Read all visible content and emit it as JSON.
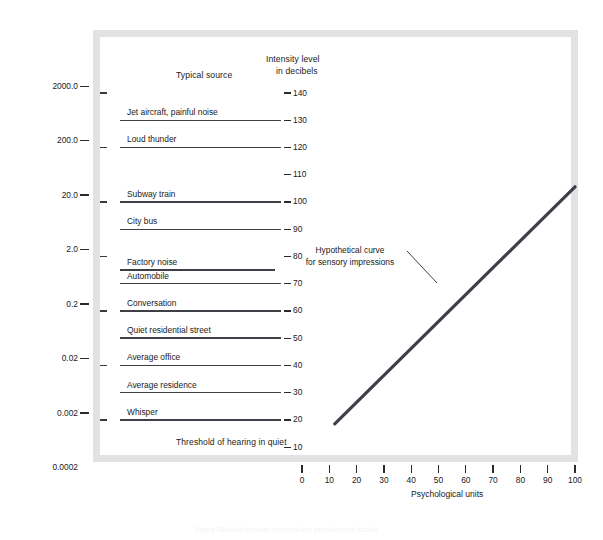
{
  "figure": {
    "y_axis_title": "Physical pressure (dynes/cm",
    "y_axis_title_sup": "2",
    "y_axis_title_tail": ")",
    "x_axis_title": "Psychological units",
    "column_header_source": "Typical source",
    "column_header_intensity_line1": "Intensity level",
    "column_header_intensity_line2": "in decibels",
    "annotation_line1": "Hypothetical curve",
    "annotation_line2": "for sensory impressions",
    "caption_ghost": "Figure  Relation between physical and psychological scales"
  },
  "chart_data": {
    "type": "line",
    "title": "",
    "xlabel": "Psychological units",
    "ylabel": "Physical pressure (dynes/cm2)",
    "xlim": [
      0,
      100
    ],
    "grid": false,
    "legend": "none",
    "x_ticks": [
      0,
      10,
      20,
      30,
      40,
      50,
      60,
      70,
      80,
      90,
      100
    ],
    "x_tick_labels": [
      "0",
      "10",
      "20",
      "30",
      "40",
      "50",
      "60",
      "70",
      "80",
      "90",
      "100"
    ],
    "y_pressure_ticks": [
      "2000.0",
      "200.0",
      "20.0",
      "2.0",
      "0.2",
      "0.02",
      "0.002",
      "0.0002"
    ],
    "y_pressure_values": [
      2000.0,
      200.0,
      20.0,
      2.0,
      0.2,
      0.02,
      0.002,
      0.0002
    ],
    "decibel_ticks": [
      140,
      130,
      120,
      110,
      100,
      90,
      80,
      70,
      60,
      50,
      40,
      30,
      20,
      10
    ],
    "decibel_tick_labels": [
      "140",
      "130",
      "120",
      "110",
      "100",
      "90",
      "80",
      "70",
      "60",
      "50",
      "40",
      "30",
      "20",
      "10"
    ],
    "sources": [
      {
        "label": "Jet aircraft, painful noise",
        "decibels": 130
      },
      {
        "label": "Loud thunder",
        "decibels": 120
      },
      {
        "label": "Subway train",
        "decibels": 100
      },
      {
        "label": "City bus",
        "decibels": 90
      },
      {
        "label": "Factory noise",
        "decibels": 75
      },
      {
        "label": "Automobile",
        "decibels": 70
      },
      {
        "label": "Conversation",
        "decibels": 60
      },
      {
        "label": "Quiet residential street",
        "decibels": 50
      },
      {
        "label": "Average office",
        "decibels": 40
      },
      {
        "label": "Average residence",
        "decibels": 30
      },
      {
        "label": "Whisper",
        "decibels": 20
      }
    ],
    "threshold_note": "Threshold of hearing in quiet",
    "series": [
      {
        "name": "Hypothetical curve for sensory impressions",
        "x": [
          12,
          100
        ],
        "y_decibels": [
          16,
          103
        ],
        "color": "#3f3f48"
      }
    ],
    "annotation": {
      "text": "Hypothetical curve for sensory impressions",
      "x": 47,
      "y_decibels": 66
    }
  }
}
